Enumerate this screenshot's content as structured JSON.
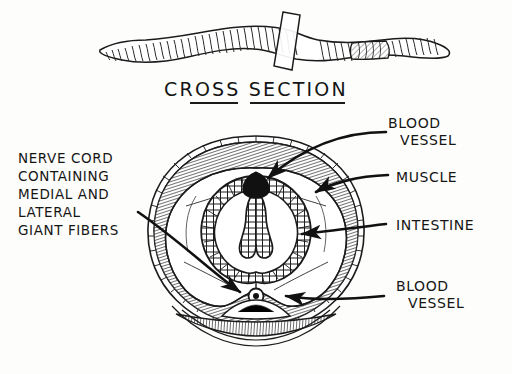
{
  "figure": {
    "title": "CROSS SECTION",
    "ink_color": "#151515",
    "background_color": "#fdfdfb"
  },
  "specimen": {
    "name": "earthworm-whole-body",
    "segment_count_visible": 58,
    "clitellum_label": "clitellum-band",
    "cut_plane_label": "cutting-plane"
  },
  "labels": {
    "nerve_cord": {
      "name": "nerve-cord-label",
      "lines": [
        "NERVE CORD",
        "CONTAINING",
        "MEDIAL AND",
        "LATERAL",
        "GIANT FIBERS"
      ]
    },
    "blood_vessel_top": {
      "name": "blood-vessel-dorsal-label",
      "lines": [
        "BLOOD",
        "VESSEL"
      ]
    },
    "muscle": {
      "name": "muscle-label",
      "lines": [
        "MUSCLE"
      ]
    },
    "intestine": {
      "name": "intestine-label",
      "lines": [
        "INTESTINE"
      ]
    },
    "blood_vessel_bottom": {
      "name": "blood-vessel-ventral-label",
      "lines": [
        "BLOOD",
        "VESSEL"
      ]
    }
  },
  "structures": [
    {
      "id": "cuticle",
      "label": "cuticle-outer-ring"
    },
    {
      "id": "muscle-layer",
      "label": "muscle-layer-hatched"
    },
    {
      "id": "coelom",
      "label": "coelom-cavity"
    },
    {
      "id": "intestine",
      "label": "intestine-wall"
    },
    {
      "id": "typhlosole",
      "label": "typhlosole-fold"
    },
    {
      "id": "dorsal-vessel",
      "label": "dorsal-blood-vessel"
    },
    {
      "id": "ventral-vessel",
      "label": "ventral-blood-vessel"
    },
    {
      "id": "nerve-cord",
      "label": "ventral-nerve-cord"
    }
  ],
  "pointers": [
    {
      "id": "p1",
      "from": "blood-vessel-dorsal-label",
      "to": "dorsal-blood-vessel"
    },
    {
      "id": "p2",
      "from": "muscle-label",
      "to": "muscle-layer-hatched"
    },
    {
      "id": "p3",
      "from": "intestine-label",
      "to": "intestine-wall"
    },
    {
      "id": "p4",
      "from": "blood-vessel-ventral-label",
      "to": "ventral-blood-vessel"
    },
    {
      "id": "p5",
      "from": "nerve-cord-label",
      "to": "ventral-nerve-cord"
    }
  ]
}
